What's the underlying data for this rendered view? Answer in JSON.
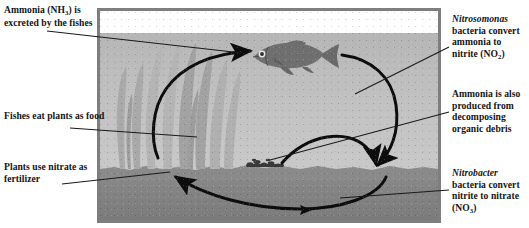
{
  "diagram": {
    "tank": {
      "air_band": "air",
      "water_band": "water",
      "substrate_band": "gravel"
    },
    "scene_objects": {
      "fish_label": "fish",
      "plant_label": "aquatic plants",
      "debris_label": "organic debris"
    },
    "colors": {
      "frame": "#7e7e7e",
      "water": "#c0c0c0",
      "gravel": "#848484",
      "air": "#ffffff",
      "plant": "#a8a8a8",
      "fish": "#6e6e6e",
      "arrow": "#0d0d0d",
      "leader": "#1a1a1a",
      "text": "#151515"
    }
  },
  "labels": {
    "ammonia_excreted": {
      "text_1": "Ammonia (NH",
      "sub_1": "3",
      "text_2": ") is excreted by the fishes",
      "plain": "Ammonia (NH3) is excreted by the fishes"
    },
    "fishes_eat_plants": {
      "plain": "Fishes eat plants as food"
    },
    "plants_use_nitrate": {
      "plain": "Plants use nitrate as fertilizer"
    },
    "nitrosomonas": {
      "genus": "Nitrosomonas",
      "text_1": " bacteria convert ammonia to nitrite (NO",
      "sub_1": "2",
      "text_2": ")",
      "plain": "Nitrosomonas bacteria convert ammonia to nitrite (NO2)"
    },
    "ammonia_decomposing": {
      "plain": "Ammonia is also produced from decomposing organic debris"
    },
    "nitrobacter": {
      "genus": "Nitrobacter",
      "text_1": " bacteria convert nitrite to nitrate (NO",
      "sub_1": "3",
      "text_2": ")",
      "plain": "Nitrobacter bacteria convert nitrite to nitrate (NO3)"
    }
  },
  "flow_arrows": [
    {
      "name": "plants-to-fish",
      "from": "plants",
      "to": "fish",
      "meaning": "fishes eat plants as food"
    },
    {
      "name": "fish-to-gravel",
      "from": "fish",
      "to": "gravel",
      "meaning": "ammonia excreted, nitrified by bacteria"
    },
    {
      "name": "debris-to-gravel",
      "from": "debris",
      "to": "gravel",
      "meaning": "ammonia from decomposing organic debris"
    },
    {
      "name": "gravel-to-plants",
      "from": "gravel",
      "to": "plants",
      "meaning": "plants use nitrate as fertilizer"
    }
  ]
}
